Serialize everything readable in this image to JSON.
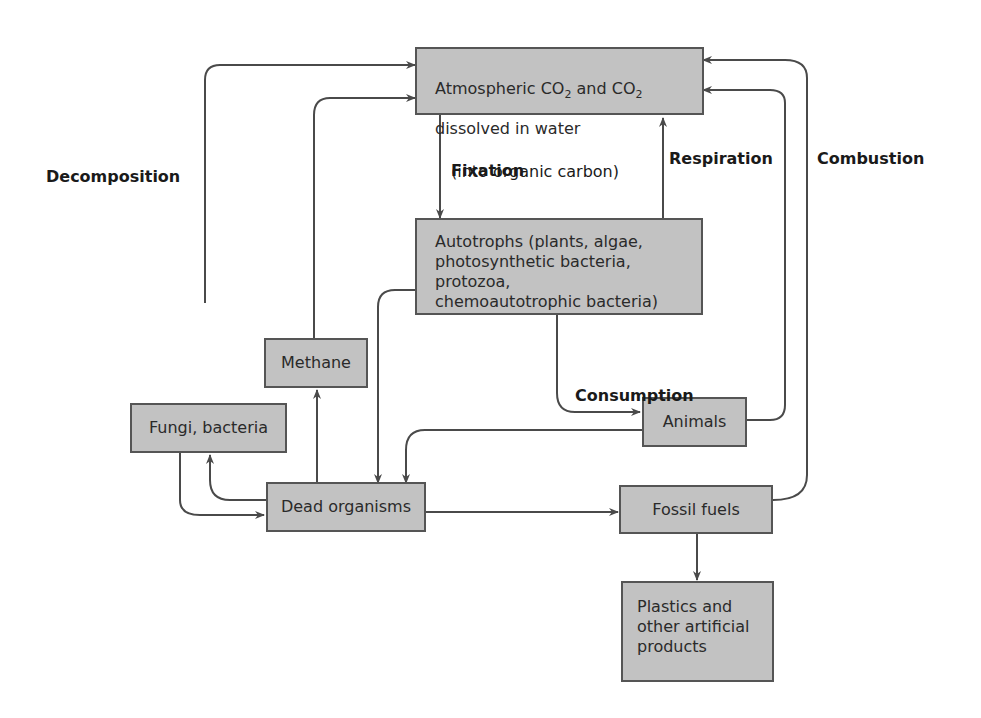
{
  "diagram": {
    "nodes": {
      "atmosphere": {
        "line1_a": "Atmospheric CO",
        "line1_sub1": "2",
        "line1_b": " and CO",
        "line1_sub2": "2",
        "line2": "dissolved in water"
      },
      "autotrophs": "Autotrophs (plants, algae,\nphotosynthetic bacteria, protozoa,\nchemoautotrophic bacteria)",
      "methane": "Methane",
      "fungi": "Fungi, bacteria",
      "animals": "Animals",
      "dead": "Dead organisms",
      "fossil": "Fossil fuels",
      "plastics": "Plastics and\nother artificial\nproducts"
    },
    "process_labels": {
      "decomposition": "Decomposition",
      "fixation": "Fixation",
      "fixation_note": "(into organic carbon)",
      "respiration": "Respiration",
      "combustion": "Combustion",
      "consumption": "Consumption"
    },
    "colors": {
      "box_fill": "#c2c2c2",
      "box_border": "#555555",
      "arrow": "#4a4a4a"
    }
  }
}
